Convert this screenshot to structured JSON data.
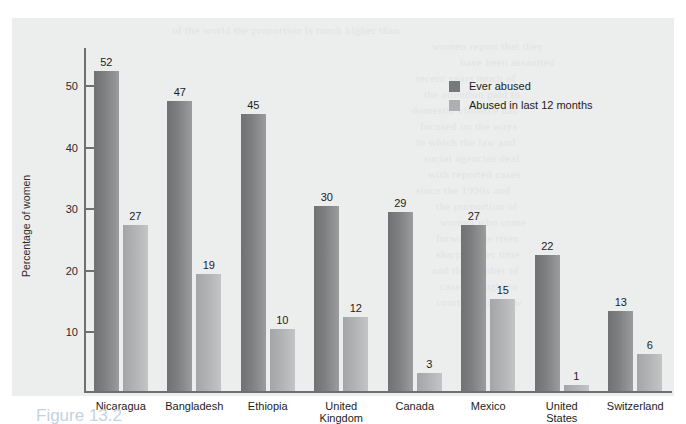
{
  "caption": "Figure 13.2",
  "legend": {
    "items": [
      {
        "label": "Ever abused",
        "color": "#76797a"
      },
      {
        "label": "Abused in last 12 months",
        "color": "#adafb0"
      }
    ]
  },
  "chart_data": {
    "type": "bar",
    "title": "",
    "xlabel": "",
    "ylabel": "Percentage of women",
    "ylim": [
      0,
      56
    ],
    "yticks": [
      10,
      20,
      30,
      40,
      50
    ],
    "grid": false,
    "legend_position": "top-right",
    "categories": [
      "Nicaragua",
      "Bangladesh",
      "Ethiopia",
      "United\nKingdom",
      "Canada",
      "Mexico",
      "United\nStates",
      "Switzerland"
    ],
    "series": [
      {
        "name": "Ever abused",
        "color": "#76797a",
        "values": [
          52,
          47,
          45,
          30,
          29,
          27,
          22,
          13
        ]
      },
      {
        "name": "Abused in last 12 months",
        "color": "#adafb0",
        "values": [
          27,
          19,
          10,
          12,
          3,
          15,
          1,
          6
        ]
      }
    ]
  },
  "bleed_text": [
    {
      "t": "of the world the proportion is much higher than",
      "x": 160,
      "y": 6
    },
    {
      "t": "women report that they",
      "x": 420,
      "y": 22
    },
    {
      "t": "have been assaulted",
      "x": 448,
      "y": 38
    },
    {
      "t": "recent years much of",
      "x": 404,
      "y": 54
    },
    {
      "t": "the attention paid to",
      "x": 412,
      "y": 70
    },
    {
      "t": "domestic violence has",
      "x": 400,
      "y": 86
    },
    {
      "t": "focused on the ways",
      "x": 408,
      "y": 102
    },
    {
      "t": "in which the law and",
      "x": 404,
      "y": 118
    },
    {
      "t": "social agencies deal",
      "x": 412,
      "y": 134
    },
    {
      "t": "with reported cases",
      "x": 416,
      "y": 150
    },
    {
      "t": "since the 1990s and",
      "x": 404,
      "y": 166
    },
    {
      "t": "the proportion of",
      "x": 424,
      "y": 182
    },
    {
      "t": "women who come",
      "x": 428,
      "y": 198
    },
    {
      "t": "forward has risen",
      "x": 424,
      "y": 214
    },
    {
      "t": "sharply over time",
      "x": 424,
      "y": 230
    },
    {
      "t": "and the number of",
      "x": 420,
      "y": 246
    },
    {
      "t": "cases brought to",
      "x": 428,
      "y": 262
    },
    {
      "t": "court remains low",
      "x": 424,
      "y": 278
    }
  ]
}
